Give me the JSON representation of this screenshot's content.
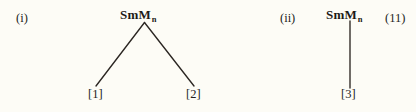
{
  "page": {
    "background_color": "#fdfcf6",
    "ink_color": "#231f1c",
    "equation_number": "(11)"
  },
  "schemes": [
    {
      "label": "(i)",
      "parent": {
        "formula": "SmM",
        "subscript": "n"
      },
      "branch_type": "v-split",
      "products": [
        {
          "label": "[1]"
        },
        {
          "label": "[2]"
        }
      ]
    },
    {
      "label": "(ii)",
      "parent": {
        "formula": "SmM",
        "subscript": "n"
      },
      "branch_type": "single-vertical",
      "products": [
        {
          "label": "[3]"
        }
      ]
    }
  ]
}
